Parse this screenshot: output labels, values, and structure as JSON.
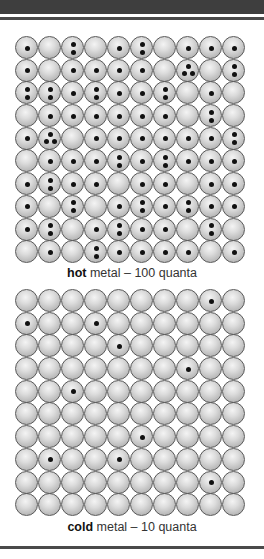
{
  "colors": {
    "header": "#3e3e3e",
    "atom_outline": "#5a5a5a",
    "quantum_dot": "#111111"
  },
  "hot": {
    "label_bold": "hot",
    "label_rest": " metal – 100 quanta",
    "total_quanta": 100,
    "rows": [
      [
        1,
        0,
        2,
        0,
        1,
        2,
        0,
        1,
        1,
        1
      ],
      [
        1,
        0,
        1,
        1,
        1,
        1,
        0,
        3,
        0,
        2
      ],
      [
        2,
        2,
        1,
        2,
        1,
        1,
        2,
        0,
        1,
        0
      ],
      [
        0,
        1,
        1,
        1,
        1,
        1,
        1,
        0,
        2,
        0
      ],
      [
        1,
        3,
        0,
        1,
        1,
        1,
        1,
        1,
        1,
        2
      ],
      [
        0,
        1,
        1,
        1,
        2,
        1,
        2,
        1,
        1,
        1
      ],
      [
        1,
        2,
        1,
        1,
        0,
        1,
        1,
        0,
        1,
        1
      ],
      [
        1,
        0,
        2,
        0,
        1,
        2,
        1,
        2,
        1,
        1
      ],
      [
        1,
        2,
        0,
        1,
        2,
        1,
        1,
        0,
        2,
        0
      ],
      [
        0,
        1,
        0,
        2,
        1,
        1,
        1,
        1,
        0,
        1
      ]
    ]
  },
  "cold": {
    "label_bold": "cold",
    "label_rest": " metal – 10 quanta",
    "total_quanta": 10,
    "rows": [
      [
        0,
        0,
        0,
        0,
        0,
        0,
        0,
        0,
        1,
        0
      ],
      [
        1,
        0,
        0,
        1,
        0,
        0,
        0,
        0,
        0,
        0
      ],
      [
        0,
        0,
        0,
        0,
        1,
        0,
        0,
        0,
        0,
        0
      ],
      [
        0,
        0,
        0,
        0,
        0,
        0,
        0,
        1,
        0,
        0
      ],
      [
        0,
        0,
        1,
        0,
        0,
        0,
        0,
        0,
        0,
        0
      ],
      [
        0,
        0,
        0,
        0,
        0,
        0,
        0,
        0,
        0,
        0
      ],
      [
        0,
        0,
        0,
        0,
        0,
        1,
        0,
        0,
        0,
        0
      ],
      [
        0,
        1,
        0,
        0,
        1,
        0,
        0,
        0,
        0,
        0
      ],
      [
        0,
        0,
        0,
        0,
        0,
        0,
        0,
        0,
        1,
        0
      ],
      [
        0,
        0,
        0,
        0,
        0,
        0,
        0,
        0,
        0,
        0
      ]
    ]
  }
}
